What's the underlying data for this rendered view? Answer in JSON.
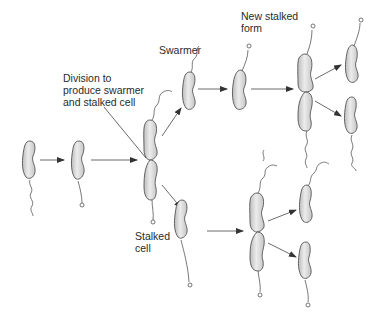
{
  "diagram": {
    "labels": {
      "division": [
        "Division to",
        "produce swarmer",
        "and stalked cell"
      ],
      "swarmer": "Swarmer",
      "new_stalked_form": [
        "New stalked",
        "form"
      ],
      "stalked_cell": [
        "Stalked",
        "cell"
      ]
    },
    "colors": {
      "cell_fill_light": "#ececec",
      "cell_fill_dark": "#bdbdbd",
      "outline": "#555555",
      "text": "#2a2a2a",
      "background": "#ffffff"
    }
  }
}
